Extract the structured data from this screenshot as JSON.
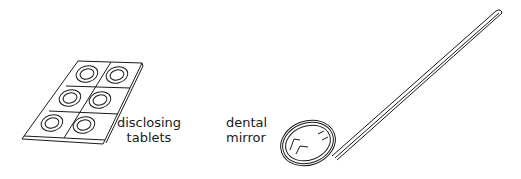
{
  "figure": {
    "items": [
      {
        "id": "tablets",
        "label_lines": [
          "disclosing",
          "tablets"
        ],
        "icon": "disclosing-tablets-pack-icon"
      },
      {
        "id": "mirror",
        "label_lines": [
          "dental",
          "mirror"
        ],
        "icon": "dental-mirror-icon"
      }
    ],
    "colors": {
      "line": "#1a1a1a",
      "background": "#ffffff"
    }
  }
}
